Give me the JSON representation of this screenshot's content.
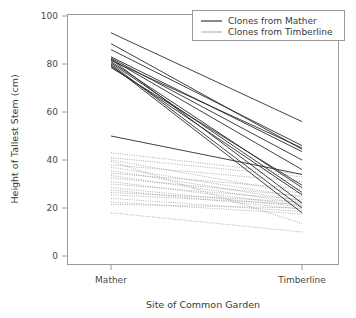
{
  "chart_data": {
    "type": "line",
    "title": "",
    "xlabel": "Site of Common Garden",
    "ylabel": "Height of Tallest Stem (cm)",
    "categories": [
      "Mather",
      "Timberline"
    ],
    "xticks": [
      "Mather",
      "Timberline"
    ],
    "yticks": [
      "0",
      "20",
      "40",
      "60",
      "80",
      "100"
    ],
    "ylim": [
      0,
      100
    ],
    "grid": false,
    "legend_position": "top-right",
    "legend": [
      "Clones from Mather",
      "Clones from Timberline"
    ],
    "colors": {
      "mather": "#2b2b2b",
      "timberline": "#9c9c9c",
      "axis": "#9a9a9a",
      "text": "#3a3a3a",
      "background": "#ffffff"
    },
    "series": [
      {
        "name": "Clones from Mather",
        "style": "solid",
        "color": "#2b2b2b",
        "clones": [
          {
            "Mather": 93.0,
            "Timberline": 56.0
          },
          {
            "Mather": 88.5,
            "Timberline": 44.5
          },
          {
            "Mather": 86.0,
            "Timberline": 46.0
          },
          {
            "Mather": 83.0,
            "Timberline": 43.5
          },
          {
            "Mather": 82.5,
            "Timberline": 40.0
          },
          {
            "Mather": 82.0,
            "Timberline": 36.0
          },
          {
            "Mather": 81.5,
            "Timberline": 45.0
          },
          {
            "Mather": 81.0,
            "Timberline": 28.5
          },
          {
            "Mather": 80.5,
            "Timberline": 26.5
          },
          {
            "Mather": 80.0,
            "Timberline": 20.0
          },
          {
            "Mather": 79.5,
            "Timberline": 18.0
          },
          {
            "Mather": 79.0,
            "Timberline": 25.5
          },
          {
            "Mather": 78.5,
            "Timberline": 29.5
          },
          {
            "Mather": 82.0,
            "Timberline": 22.0
          },
          {
            "Mather": 50.0,
            "Timberline": 34.0
          }
        ]
      },
      {
        "name": "Clones from Timberline",
        "style": "dotted",
        "color": "#9c9c9c",
        "clones": [
          {
            "Mather": 43.0,
            "Timberline": 34.0
          },
          {
            "Mather": 41.0,
            "Timberline": 33.0
          },
          {
            "Mather": 40.0,
            "Timberline": 26.0
          },
          {
            "Mather": 38.0,
            "Timberline": 31.0
          },
          {
            "Mather": 37.0,
            "Timberline": 24.5
          },
          {
            "Mather": 35.5,
            "Timberline": 23.0
          },
          {
            "Mather": 34.5,
            "Timberline": 28.0
          },
          {
            "Mather": 33.5,
            "Timberline": 22.0
          },
          {
            "Mather": 32.5,
            "Timberline": 25.0
          },
          {
            "Mather": 31.0,
            "Timberline": 21.0
          },
          {
            "Mather": 30.0,
            "Timberline": 23.5
          },
          {
            "Mather": 28.5,
            "Timberline": 20.5
          },
          {
            "Mather": 27.5,
            "Timberline": 19.5
          },
          {
            "Mather": 26.5,
            "Timberline": 22.5
          },
          {
            "Mather": 25.5,
            "Timberline": 21.5
          },
          {
            "Mather": 24.0,
            "Timberline": 18.5
          },
          {
            "Mather": 22.5,
            "Timberline": 17.5
          },
          {
            "Mather": 21.5,
            "Timberline": 20.0
          },
          {
            "Mather": 18.0,
            "Timberline": 10.0
          },
          {
            "Mather": 39.5,
            "Timberline": 13.5
          }
        ]
      }
    ]
  }
}
